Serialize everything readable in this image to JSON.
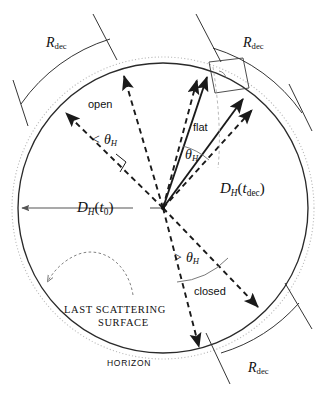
{
  "figure": {
    "type": "cosmology-horizon-diagram",
    "width": 318,
    "height": 417,
    "background": "#ffffff",
    "ink": "#111111"
  },
  "geometry": {
    "center": {
      "x": 163,
      "y": 208
    },
    "lss_radius": 145,
    "horizon_radius": 151,
    "rdec_arc_radius": 170
  },
  "labels": {
    "rdec_top_left": {
      "base": "R",
      "sub": "dec",
      "x": 46,
      "y": 36
    },
    "rdec_top_right": {
      "base": "R",
      "sub": "dec",
      "x": 243,
      "y": 36
    },
    "rdec_bottom_right": {
      "base": "R",
      "sub": "dec",
      "x": 248,
      "y": 361
    },
    "dh_t0": {
      "base": "D",
      "basesub": "H",
      "paren_open": "(",
      "arg": "t",
      "argsub": "0",
      "paren_close": ")",
      "x": 77,
      "y": 200
    },
    "dh_tdec": {
      "base": "D",
      "basesub": "H",
      "paren_open": "(",
      "arg": "t",
      "argsub": "dec",
      "paren_close": ")",
      "x": 220,
      "y": 181
    },
    "theta_open": {
      "text": "< θ",
      "sub": "H",
      "x": 91,
      "y": 133
    },
    "theta_flat": {
      "text": "θ",
      "sub": "H",
      "x": 185,
      "y": 148
    },
    "theta_closed": {
      "text": "> θ",
      "sub": "H",
      "x": 173,
      "y": 251
    },
    "open": {
      "text": "open",
      "x": 88,
      "y": 99
    },
    "flat": {
      "text": "flat",
      "x": 193,
      "y": 122
    },
    "closed": {
      "text": "closed",
      "x": 194,
      "y": 286
    },
    "last_scattering_line1": {
      "text": "LAST SCATTERING",
      "x": 64,
      "y": 305
    },
    "last_scattering_line2": {
      "text": "SURFACE",
      "x": 98,
      "y": 318
    },
    "horizon": {
      "text": "HORIZON",
      "x": 107,
      "y": 359
    }
  },
  "colors": {
    "lss_circle": "#2a2a2a",
    "horizon_circle": "#b9b9b9",
    "rays_dashed": "#1a1a1a",
    "rays_solid": "#1a1a1a",
    "rdec_bracket": "#2a2a2a",
    "faint_guide": "#9a9a9a",
    "dh_arrow": "#555555"
  },
  "elements": {
    "lss_circle_name": "last-scattering-surface-circle",
    "horizon_circle_name": "horizon-circle",
    "center_point_name": "observer-center-point",
    "open_pair_name": "open-geometry-ray-pair",
    "flat_pair_name": "flat-geometry-ray-pair",
    "closed_pair_name": "closed-geometry-ray-pair",
    "dh_t0_arrow_name": "dh-t0-measure-arrow",
    "dh_tdec_guide_name": "dh-tdec-leader-line",
    "curved_arrow_name": "horizon-callout-curved-arrow",
    "right_angle_box_name": "rdec-chord-box"
  }
}
